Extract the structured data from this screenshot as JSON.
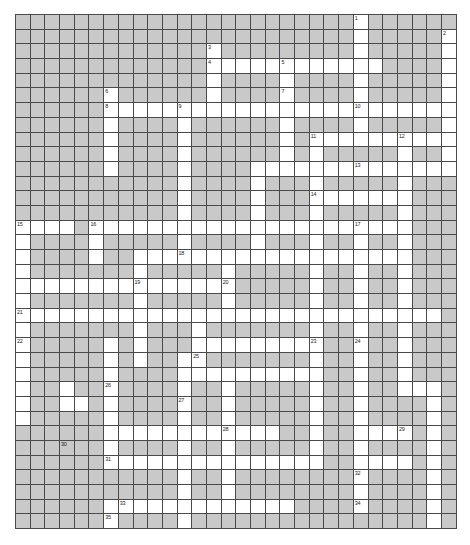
{
  "page": {
    "background_color": "#ffffff"
  },
  "grid": {
    "columns": 30,
    "rows": 35,
    "cell_size_px": 14.7,
    "origin_x_px": 15,
    "origin_y_px": 14,
    "block_color": "#c9c9c9",
    "open_color": "#ffffff",
    "line_color": "#4a4a4a",
    "number_color": "#1a1a1a",
    "white_cells": [
      [
        0,
        23
      ],
      [
        1,
        23
      ],
      [
        1,
        29
      ],
      [
        2,
        13
      ],
      [
        2,
        23
      ],
      [
        2,
        29
      ],
      [
        3,
        13
      ],
      [
        3,
        14
      ],
      [
        3,
        15
      ],
      [
        3,
        16
      ],
      [
        3,
        17
      ],
      [
        3,
        18
      ],
      [
        3,
        19
      ],
      [
        3,
        20
      ],
      [
        3,
        21
      ],
      [
        3,
        22
      ],
      [
        3,
        23
      ],
      [
        3,
        24
      ],
      [
        3,
        29
      ],
      [
        4,
        13
      ],
      [
        4,
        18
      ],
      [
        4,
        23
      ],
      [
        4,
        29
      ],
      [
        5,
        6
      ],
      [
        5,
        13
      ],
      [
        5,
        18
      ],
      [
        5,
        23
      ],
      [
        5,
        29
      ],
      [
        6,
        6
      ],
      [
        6,
        7
      ],
      [
        6,
        8
      ],
      [
        6,
        9
      ],
      [
        6,
        10
      ],
      [
        6,
        11
      ],
      [
        6,
        12
      ],
      [
        6,
        13
      ],
      [
        6,
        14
      ],
      [
        6,
        15
      ],
      [
        6,
        16
      ],
      [
        6,
        17
      ],
      [
        6,
        18
      ],
      [
        6,
        19
      ],
      [
        6,
        20
      ],
      [
        6,
        21
      ],
      [
        6,
        22
      ],
      [
        6,
        23
      ],
      [
        6,
        24
      ],
      [
        6,
        25
      ],
      [
        6,
        26
      ],
      [
        6,
        27
      ],
      [
        6,
        28
      ],
      [
        6,
        29
      ],
      [
        7,
        6
      ],
      [
        7,
        11
      ],
      [
        7,
        18
      ],
      [
        7,
        23
      ],
      [
        7,
        29
      ],
      [
        8,
        6
      ],
      [
        8,
        11
      ],
      [
        8,
        18
      ],
      [
        8,
        20
      ],
      [
        8,
        21
      ],
      [
        8,
        22
      ],
      [
        8,
        23
      ],
      [
        8,
        24
      ],
      [
        8,
        25
      ],
      [
        8,
        26
      ],
      [
        8,
        27
      ],
      [
        8,
        28
      ],
      [
        8,
        29
      ],
      [
        9,
        6
      ],
      [
        9,
        11
      ],
      [
        9,
        18
      ],
      [
        9,
        20
      ],
      [
        9,
        26
      ],
      [
        9,
        29
      ],
      [
        10,
        6
      ],
      [
        10,
        11
      ],
      [
        10,
        16
      ],
      [
        10,
        17
      ],
      [
        10,
        18
      ],
      [
        10,
        19
      ],
      [
        10,
        20
      ],
      [
        10,
        21
      ],
      [
        10,
        22
      ],
      [
        10,
        23
      ],
      [
        10,
        24
      ],
      [
        10,
        25
      ],
      [
        10,
        26
      ],
      [
        10,
        27
      ],
      [
        10,
        28
      ],
      [
        10,
        29
      ],
      [
        11,
        11
      ],
      [
        11,
        16
      ],
      [
        11,
        20
      ],
      [
        11,
        26
      ],
      [
        12,
        11
      ],
      [
        12,
        16
      ],
      [
        12,
        20
      ],
      [
        12,
        21
      ],
      [
        12,
        22
      ],
      [
        12,
        23
      ],
      [
        12,
        24
      ],
      [
        12,
        25
      ],
      [
        12,
        26
      ],
      [
        13,
        11
      ],
      [
        13,
        16
      ],
      [
        13,
        20
      ],
      [
        13,
        26
      ],
      [
        14,
        0
      ],
      [
        14,
        1
      ],
      [
        14,
        2
      ],
      [
        14,
        3
      ],
      [
        14,
        5
      ],
      [
        14,
        6
      ],
      [
        14,
        7
      ],
      [
        14,
        8
      ],
      [
        14,
        9
      ],
      [
        14,
        10
      ],
      [
        14,
        11
      ],
      [
        14,
        12
      ],
      [
        14,
        13
      ],
      [
        14,
        14
      ],
      [
        14,
        15
      ],
      [
        14,
        16
      ],
      [
        14,
        17
      ],
      [
        14,
        18
      ],
      [
        14,
        19
      ],
      [
        14,
        20
      ],
      [
        14,
        21
      ],
      [
        14,
        22
      ],
      [
        14,
        23
      ],
      [
        14,
        24
      ],
      [
        14,
        25
      ],
      [
        14,
        26
      ],
      [
        15,
        0
      ],
      [
        15,
        5
      ],
      [
        15,
        11
      ],
      [
        15,
        16
      ],
      [
        15,
        20
      ],
      [
        15,
        23
      ],
      [
        15,
        26
      ],
      [
        16,
        0
      ],
      [
        16,
        5
      ],
      [
        16,
        8
      ],
      [
        16,
        9
      ],
      [
        16,
        10
      ],
      [
        16,
        11
      ],
      [
        16,
        12
      ],
      [
        16,
        13
      ],
      [
        16,
        14
      ],
      [
        16,
        15
      ],
      [
        16,
        16
      ],
      [
        16,
        17
      ],
      [
        16,
        18
      ],
      [
        16,
        19
      ],
      [
        16,
        20
      ],
      [
        16,
        21
      ],
      [
        16,
        22
      ],
      [
        16,
        23
      ],
      [
        16,
        24
      ],
      [
        16,
        25
      ],
      [
        16,
        26
      ],
      [
        17,
        0
      ],
      [
        17,
        8
      ],
      [
        17,
        14
      ],
      [
        17,
        20
      ],
      [
        17,
        23
      ],
      [
        17,
        26
      ],
      [
        18,
        0
      ],
      [
        18,
        1
      ],
      [
        18,
        2
      ],
      [
        18,
        3
      ],
      [
        18,
        4
      ],
      [
        18,
        5
      ],
      [
        18,
        6
      ],
      [
        18,
        7
      ],
      [
        18,
        8
      ],
      [
        18,
        9
      ],
      [
        18,
        10
      ],
      [
        18,
        11
      ],
      [
        18,
        12
      ],
      [
        18,
        13
      ],
      [
        18,
        14
      ],
      [
        18,
        20
      ],
      [
        18,
        23
      ],
      [
        18,
        26
      ],
      [
        19,
        0
      ],
      [
        19,
        8
      ],
      [
        19,
        14
      ],
      [
        19,
        20
      ],
      [
        19,
        23
      ],
      [
        19,
        26
      ],
      [
        20,
        0
      ],
      [
        20,
        1
      ],
      [
        20,
        2
      ],
      [
        20,
        3
      ],
      [
        20,
        4
      ],
      [
        20,
        5
      ],
      [
        20,
        6
      ],
      [
        20,
        7
      ],
      [
        20,
        8
      ],
      [
        20,
        9
      ],
      [
        20,
        10
      ],
      [
        20,
        11
      ],
      [
        20,
        12
      ],
      [
        20,
        13
      ],
      [
        20,
        14
      ],
      [
        20,
        15
      ],
      [
        20,
        16
      ],
      [
        20,
        17
      ],
      [
        20,
        18
      ],
      [
        20,
        19
      ],
      [
        20,
        20
      ],
      [
        20,
        21
      ],
      [
        20,
        22
      ],
      [
        20,
        23
      ],
      [
        20,
        24
      ],
      [
        20,
        25
      ],
      [
        20,
        26
      ],
      [
        20,
        27
      ],
      [
        20,
        28
      ],
      [
        21,
        0
      ],
      [
        21,
        8
      ],
      [
        21,
        12
      ],
      [
        21,
        20
      ],
      [
        21,
        23
      ],
      [
        21,
        26
      ],
      [
        22,
        0
      ],
      [
        22,
        6
      ],
      [
        22,
        8
      ],
      [
        22,
        12
      ],
      [
        22,
        13
      ],
      [
        22,
        14
      ],
      [
        22,
        15
      ],
      [
        22,
        16
      ],
      [
        22,
        17
      ],
      [
        22,
        18
      ],
      [
        22,
        19
      ],
      [
        22,
        20
      ],
      [
        22,
        23
      ],
      [
        22,
        26
      ],
      [
        23,
        0
      ],
      [
        23,
        6
      ],
      [
        23,
        8
      ],
      [
        23,
        11
      ],
      [
        23,
        12
      ],
      [
        23,
        20
      ],
      [
        23,
        23
      ],
      [
        23,
        26
      ],
      [
        24,
        0
      ],
      [
        24,
        6
      ],
      [
        24,
        11
      ],
      [
        24,
        12
      ],
      [
        24,
        13
      ],
      [
        24,
        14
      ],
      [
        24,
        15
      ],
      [
        24,
        16
      ],
      [
        24,
        17
      ],
      [
        24,
        18
      ],
      [
        24,
        19
      ],
      [
        24,
        20
      ],
      [
        24,
        23
      ],
      [
        24,
        26
      ],
      [
        25,
        0
      ],
      [
        25,
        3
      ],
      [
        25,
        6
      ],
      [
        25,
        11
      ],
      [
        25,
        14
      ],
      [
        25,
        20
      ],
      [
        25,
        23
      ],
      [
        25,
        26
      ],
      [
        25,
        27
      ],
      [
        25,
        28
      ],
      [
        26,
        0
      ],
      [
        26,
        3
      ],
      [
        26,
        4
      ],
      [
        26,
        6
      ],
      [
        26,
        11
      ],
      [
        26,
        14
      ],
      [
        26,
        20
      ],
      [
        26,
        23
      ],
      [
        26,
        28
      ],
      [
        27,
        0
      ],
      [
        27,
        6
      ],
      [
        27,
        11
      ],
      [
        27,
        14
      ],
      [
        27,
        20
      ],
      [
        27,
        23
      ],
      [
        27,
        28
      ],
      [
        28,
        6
      ],
      [
        28,
        7
      ],
      [
        28,
        8
      ],
      [
        28,
        9
      ],
      [
        28,
        10
      ],
      [
        28,
        11
      ],
      [
        28,
        12
      ],
      [
        28,
        13
      ],
      [
        28,
        14
      ],
      [
        28,
        15
      ],
      [
        28,
        16
      ],
      [
        28,
        17
      ],
      [
        28,
        20
      ],
      [
        28,
        23
      ],
      [
        28,
        24
      ],
      [
        28,
        25
      ],
      [
        28,
        26
      ],
      [
        28,
        28
      ],
      [
        29,
        6
      ],
      [
        29,
        11
      ],
      [
        29,
        14
      ],
      [
        29,
        20
      ],
      [
        29,
        23
      ],
      [
        29,
        28
      ],
      [
        30,
        6
      ],
      [
        30,
        7
      ],
      [
        30,
        8
      ],
      [
        30,
        9
      ],
      [
        30,
        10
      ],
      [
        30,
        11
      ],
      [
        30,
        12
      ],
      [
        30,
        13
      ],
      [
        30,
        14
      ],
      [
        30,
        15
      ],
      [
        30,
        16
      ],
      [
        30,
        17
      ],
      [
        30,
        18
      ],
      [
        30,
        19
      ],
      [
        30,
        20
      ],
      [
        30,
        23
      ],
      [
        30,
        24
      ],
      [
        30,
        25
      ],
      [
        30,
        26
      ],
      [
        30,
        28
      ],
      [
        31,
        11
      ],
      [
        31,
        14
      ],
      [
        31,
        23
      ],
      [
        31,
        28
      ],
      [
        32,
        11
      ],
      [
        32,
        14
      ],
      [
        32,
        23
      ],
      [
        32,
        28
      ],
      [
        33,
        6
      ],
      [
        33,
        7
      ],
      [
        33,
        8
      ],
      [
        33,
        9
      ],
      [
        33,
        10
      ],
      [
        33,
        11
      ],
      [
        33,
        12
      ],
      [
        33,
        13
      ],
      [
        33,
        14
      ],
      [
        33,
        15
      ],
      [
        33,
        16
      ],
      [
        33,
        17
      ],
      [
        33,
        18
      ],
      [
        33,
        23
      ],
      [
        33,
        28
      ],
      [
        34,
        6
      ],
      [
        34,
        11
      ],
      [
        34,
        28
      ]
    ],
    "numbers": [
      {
        "row": 0,
        "col": 23,
        "label": "1"
      },
      {
        "row": 1,
        "col": 29,
        "label": "2"
      },
      {
        "row": 2,
        "col": 13,
        "label": "3"
      },
      {
        "row": 3,
        "col": 13,
        "label": "4"
      },
      {
        "row": 3,
        "col": 18,
        "label": "5"
      },
      {
        "row": 5,
        "col": 6,
        "label": "6"
      },
      {
        "row": 5,
        "col": 18,
        "label": "7"
      },
      {
        "row": 6,
        "col": 6,
        "label": "8"
      },
      {
        "row": 6,
        "col": 11,
        "label": "9"
      },
      {
        "row": 6,
        "col": 23,
        "label": "10"
      },
      {
        "row": 8,
        "col": 20,
        "label": "11"
      },
      {
        "row": 8,
        "col": 26,
        "label": "12"
      },
      {
        "row": 10,
        "col": 23,
        "label": "13"
      },
      {
        "row": 12,
        "col": 20,
        "label": "14"
      },
      {
        "row": 14,
        "col": 0,
        "label": "15"
      },
      {
        "row": 14,
        "col": 5,
        "label": "16"
      },
      {
        "row": 14,
        "col": 23,
        "label": "17"
      },
      {
        "row": 16,
        "col": 11,
        "label": "18"
      },
      {
        "row": 18,
        "col": 8,
        "label": "19"
      },
      {
        "row": 18,
        "col": 14,
        "label": "20"
      },
      {
        "row": 20,
        "col": 0,
        "label": "21"
      },
      {
        "row": 22,
        "col": 0,
        "label": "22"
      },
      {
        "row": 22,
        "col": 20,
        "label": "23"
      },
      {
        "row": 22,
        "col": 23,
        "label": "24"
      },
      {
        "row": 23,
        "col": 12,
        "label": "25"
      },
      {
        "row": 25,
        "col": 6,
        "label": "26"
      },
      {
        "row": 26,
        "col": 11,
        "label": "27"
      },
      {
        "row": 28,
        "col": 14,
        "label": "28"
      },
      {
        "row": 28,
        "col": 26,
        "label": "29"
      },
      {
        "row": 29,
        "col": 3,
        "label": "30"
      },
      {
        "row": 31,
        "col": 5,
        "label": "31"
      },
      {
        "row": 31,
        "col": 22,
        "label": "32"
      },
      {
        "row": 33,
        "col": 7,
        "label": "33"
      },
      {
        "row": 33,
        "col": 23,
        "label": "34"
      },
      {
        "row": 35,
        "col": 7,
        "label": "35"
      }
    ]
  }
}
